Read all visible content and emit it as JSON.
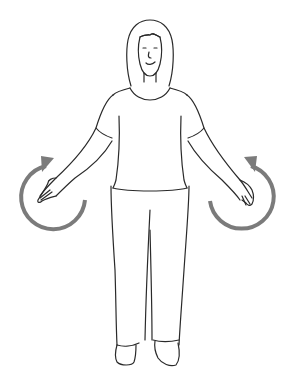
{
  "figure": {
    "description": "Woman standing with arms extended down and out, circular arrows indicating arm rotation",
    "line_color": "#2a2a2a",
    "arrow_color": "#7b7b7b",
    "background": "#ffffff"
  },
  "arrows": [
    {
      "side": "left",
      "direction": "clockwise",
      "icon": "rotate-arrow-icon"
    },
    {
      "side": "right",
      "direction": "counterclockwise",
      "icon": "rotate-arrow-icon"
    }
  ]
}
